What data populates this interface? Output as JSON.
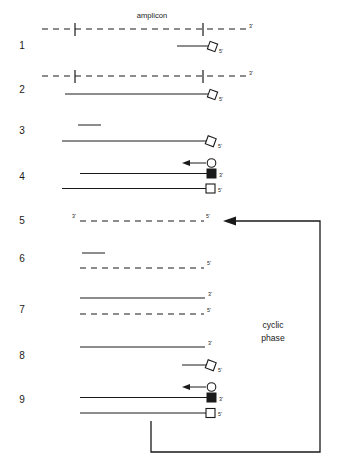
{
  "figure": {
    "title_label": "amplicon",
    "cyclic_label_line1": "cyclic",
    "cyclic_label_line2": "phase",
    "ink_color": "#1a1a1a",
    "background": "#ffffff"
  },
  "row_numbers": {
    "r1": "1",
    "r2": "2",
    "r3": "3",
    "r4": "4",
    "r5": "5",
    "r6": "6",
    "r7": "7",
    "r8": "8",
    "r9": "9"
  },
  "end_labels": {
    "row1_template_right": "3'",
    "row1_primer_right": "5'",
    "row2_template_right": "3'",
    "row2_primer_right": "5'",
    "row3_strand_right": "5'",
    "row4_black_square_right": "3'",
    "row4_open_square_right": "5'",
    "row5_left": "3'",
    "row5_right": "5'",
    "row6_dashed_right": "5'",
    "row7_solid_right": "3'",
    "row7_dashed_right": "5'",
    "row8_solid_right": "3'",
    "row8_primer_right": "5'",
    "row9_black_square_right": "3'",
    "row9_open_square_right": "5'"
  },
  "symbol_names": {
    "diamond": "open-diamond-primer-tag",
    "circle": "open-circle-tag",
    "black_square": "filled-square-tag",
    "open_square": "open-square-tag",
    "arrow": "leftward-extension-arrow"
  }
}
